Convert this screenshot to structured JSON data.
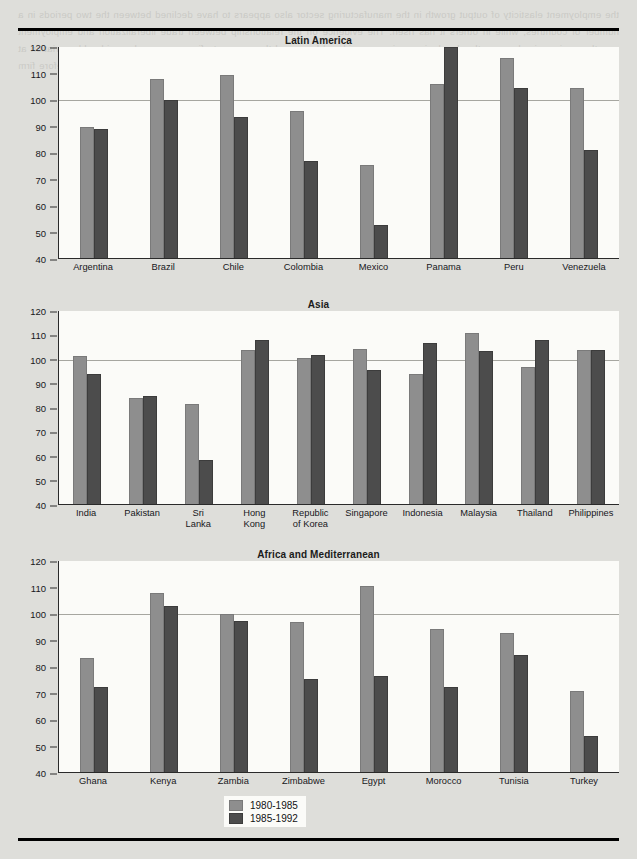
{
  "legend": {
    "items": [
      {
        "label": "1980-1985",
        "color": "#8e8e8e"
      },
      {
        "label": "1985-1992",
        "color": "#4c4c4c"
      }
    ]
  },
  "axis": {
    "ticks": [
      120,
      110,
      100,
      90,
      80,
      70,
      60,
      50,
      40
    ],
    "min": 40,
    "max": 120,
    "reference_line": 100
  },
  "ghost_text": "the employment elasticity of output growth in the manufacturing sector also appears to have declined between the two periods in a number of countries, while in others it has risen. The evidence on the relationship between trade liberalization and employment growth remains mixed across the developing regions considered here, and the aggregate figures conceal considerable variation at the country level. A more detailed examination of the sectoral composition of employment change is therefore required before firm conclusions can be drawn about the labour market consequences of structural adjustment programmes in these economies.",
  "chart_data": [
    {
      "type": "bar",
      "title": "Latin America",
      "xlabel": "",
      "ylabel": "",
      "ylim": [
        40,
        120
      ],
      "grid": false,
      "legend_position": "bottom",
      "categories": [
        "Argentina",
        "Brazil",
        "Chile",
        "Colombia",
        "Mexico",
        "Panama",
        "Peru",
        "Venezuela"
      ],
      "series": [
        {
          "name": "1980-1985",
          "values": [
            90,
            108,
            109.5,
            96,
            75.5,
            106,
            116,
            104.5
          ]
        },
        {
          "name": "1985-1992",
          "values": [
            89,
            100,
            93.5,
            77,
            53,
            120,
            104.5,
            81
          ]
        }
      ]
    },
    {
      "type": "bar",
      "title": "Asia",
      "xlabel": "",
      "ylabel": "",
      "ylim": [
        40,
        120
      ],
      "grid": false,
      "legend_position": "bottom",
      "categories": [
        "India",
        "Pakistan",
        "Sri\nLanka",
        "Hong\nKong",
        "Republic\nof Korea",
        "Singapore",
        "Indonesia",
        "Malaysia",
        "Thailand",
        "Philippines"
      ],
      "series": [
        {
          "name": "1980-1985",
          "values": [
            101.5,
            84,
            81.5,
            104,
            100.5,
            104.5,
            94,
            111,
            97,
            104
          ]
        },
        {
          "name": "1985-1992",
          "values": [
            94,
            85,
            58.5,
            108,
            102,
            95.5,
            107,
            103.5,
            108,
            104
          ]
        }
      ]
    },
    {
      "type": "bar",
      "title": "Africa and Mediterranean",
      "xlabel": "",
      "ylabel": "",
      "ylim": [
        40,
        120
      ],
      "grid": false,
      "legend_position": "bottom",
      "categories": [
        "Ghana",
        "Kenya",
        "Zambia",
        "Zimbabwe",
        "Egypt",
        "Morocco",
        "Tunisia",
        "Turkey"
      ],
      "series": [
        {
          "name": "1980-1985",
          "values": [
            83.5,
            108,
            100,
            97,
            110.5,
            94.5,
            93,
            71
          ]
        },
        {
          "name": "1985-1992",
          "values": [
            72.5,
            103,
            97.5,
            75.5,
            76.5,
            72.5,
            84.5,
            54
          ]
        }
      ]
    }
  ]
}
